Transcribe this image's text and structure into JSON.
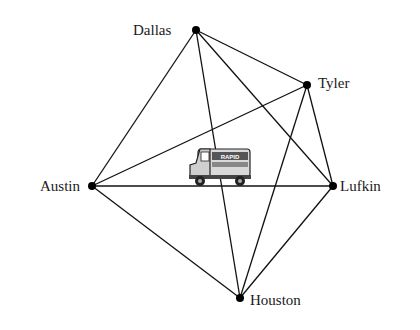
{
  "diagram": {
    "type": "complete-graph",
    "nodes": [
      {
        "id": "dallas",
        "label": "Dallas",
        "x": 196,
        "y": 30,
        "lx": 133,
        "ly": 35
      },
      {
        "id": "tyler",
        "label": "Tyler",
        "x": 307,
        "y": 85,
        "lx": 318,
        "ly": 88
      },
      {
        "id": "lufkin",
        "label": "Lufkin",
        "x": 333,
        "y": 186,
        "lx": 340,
        "ly": 191
      },
      {
        "id": "houston",
        "label": "Houston",
        "x": 240,
        "y": 298,
        "lx": 250,
        "ly": 305
      },
      {
        "id": "austin",
        "label": "Austin",
        "x": 92,
        "y": 186,
        "lx": 40,
        "ly": 191
      }
    ],
    "edges": [
      [
        "dallas",
        "austin"
      ],
      [
        "dallas",
        "tyler"
      ],
      [
        "dallas",
        "lufkin"
      ],
      [
        "dallas",
        "houston"
      ],
      [
        "austin",
        "tyler"
      ],
      [
        "austin",
        "lufkin"
      ],
      [
        "austin",
        "houston"
      ],
      [
        "tyler",
        "lufkin"
      ],
      [
        "tyler",
        "houston"
      ],
      [
        "lufkin",
        "houston"
      ]
    ],
    "truck": {
      "label": "RAPID",
      "x": 188,
      "y": 145
    }
  }
}
